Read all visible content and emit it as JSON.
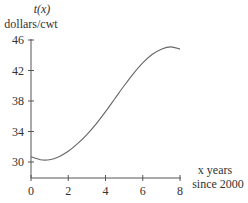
{
  "chart_data": {
    "type": "line",
    "title": "",
    "ylabel_line1": "t(x)",
    "ylabel_line2": "dollars/cwt",
    "xlabel_line1": "x years",
    "xlabel_line2": "since 2000",
    "x_ticks": [
      "0",
      "2",
      "4",
      "6",
      "8"
    ],
    "y_ticks": [
      "30",
      "34",
      "38",
      "42",
      "46"
    ],
    "xlim": [
      0,
      8
    ],
    "ylim": [
      28.4,
      46
    ],
    "grid": false,
    "series": [
      {
        "name": "t(x)",
        "x": [
          0,
          0.5,
          1,
          1.5,
          2,
          2.5,
          3,
          3.5,
          4,
          4.5,
          5,
          5.5,
          6,
          6.5,
          7,
          7.5,
          8
        ],
        "values": [
          30.7,
          30.3,
          30.3,
          30.7,
          31.4,
          32.4,
          33.6,
          35.0,
          36.6,
          38.3,
          40.0,
          41.6,
          43.0,
          44.1,
          44.8,
          45.1,
          44.8
        ]
      }
    ]
  }
}
